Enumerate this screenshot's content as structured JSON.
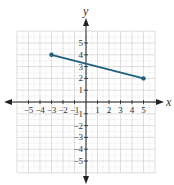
{
  "chart_data": {
    "type": "line",
    "title": "",
    "xlabel": "x",
    "ylabel": "y",
    "xlim": [
      -6,
      6
    ],
    "ylim": [
      -6,
      6
    ],
    "grid": true,
    "x_ticks": [
      -5,
      -4,
      -3,
      -2,
      -1,
      1,
      2,
      3,
      4,
      5
    ],
    "y_ticks": [
      -5,
      -4,
      -3,
      -2,
      -1,
      1,
      2,
      3,
      4,
      5
    ],
    "x_tick_labels": [
      "−5",
      "−4",
      "−3",
      "−2",
      "−1",
      "1",
      "2",
      "3",
      "4",
      "5"
    ],
    "y_tick_labels": [
      "−5",
      "−4",
      "−3",
      "−2",
      "−1",
      "1",
      "2",
      "3",
      "4",
      "5"
    ],
    "series": [
      {
        "name": "segment",
        "points": [
          [
            -3,
            4
          ],
          [
            5,
            2
          ]
        ],
        "endpoints_marked": true,
        "color": "#1f5f7f"
      }
    ]
  },
  "colors": {
    "grid": "#d0d0d0",
    "axis": "#222222",
    "line": "#1f5f7f"
  }
}
